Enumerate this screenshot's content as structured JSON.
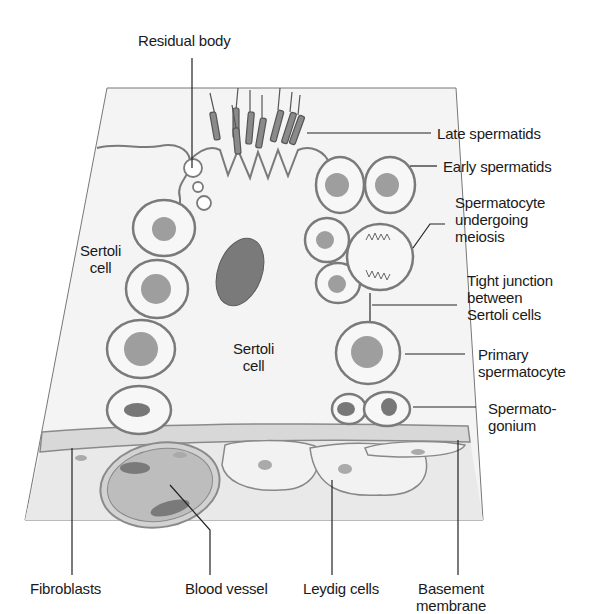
{
  "figure": {
    "colors": {
      "background": "#ffffff",
      "tissue_fill": "#f3f3f3",
      "tissue_outline": "#6a6a6a",
      "cell_membrane": "#7a7a7a",
      "nucleus": "#9a9a9a",
      "dark_nucleus": "#6e6e6e",
      "basement_membrane": "#d6d6d6",
      "interstitium": "#e8e8e8",
      "text": "#1a1a1a"
    }
  },
  "labels": {
    "residual_body": "Residual body",
    "late_spermatids": "Late spermatids",
    "early_spermatids": "Early spermatids",
    "spermatocyte_meiosis": "Spermatocyte\nundergoing\nmeiosis",
    "tight_junction": "Tight junction\nbetween\nSertoli cells",
    "primary_spermatocyte": "Primary\nspermatocyte",
    "spermatogonium": "Spermato-\ngonium",
    "sertoli_cell_left": "Sertoli\ncell",
    "sertoli_cell_center": "Sertoli\ncell",
    "fibroblasts": "Fibroblasts",
    "blood_vessel": "Blood vessel",
    "leydig_cells": "Leydig cells",
    "basement_membrane": "Basement\nmembrane"
  }
}
